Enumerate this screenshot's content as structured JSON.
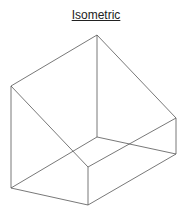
{
  "title": "Isometric",
  "diagram": {
    "type": "isometric-wireframe",
    "vertices": {
      "apex": [
        97,
        35
      ],
      "left_top": [
        11,
        86
      ],
      "right_top": [
        176,
        118
      ],
      "inner": [
        97,
        137
      ],
      "front_top": [
        88,
        167
      ],
      "right_bottom": [
        176,
        154
      ],
      "left_bottom": [
        11,
        188
      ],
      "front_bottom": [
        88,
        205
      ]
    },
    "edge_color": "#555555"
  }
}
